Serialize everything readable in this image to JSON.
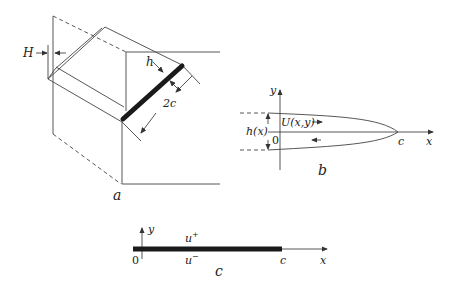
{
  "panels": {
    "a": {
      "caption": "a",
      "labels": {
        "H": "H",
        "h": "h",
        "two_c": "2c"
      }
    },
    "b": {
      "caption": "b",
      "labels": {
        "y_axis": "y",
        "x_axis": "x",
        "origin": "0",
        "tip": "c",
        "thickness": "h(x)",
        "velocity": "U(x,y)"
      }
    },
    "c": {
      "caption": "c",
      "labels": {
        "y_axis": "y",
        "x_axis": "x",
        "origin": "0",
        "tip": "c",
        "upper": "u",
        "upper_sup": "+",
        "lower": "u",
        "lower_sup": "−"
      }
    }
  },
  "colors": {
    "line": "#333333",
    "crack": "#1a1a1a",
    "background": "#ffffff"
  }
}
